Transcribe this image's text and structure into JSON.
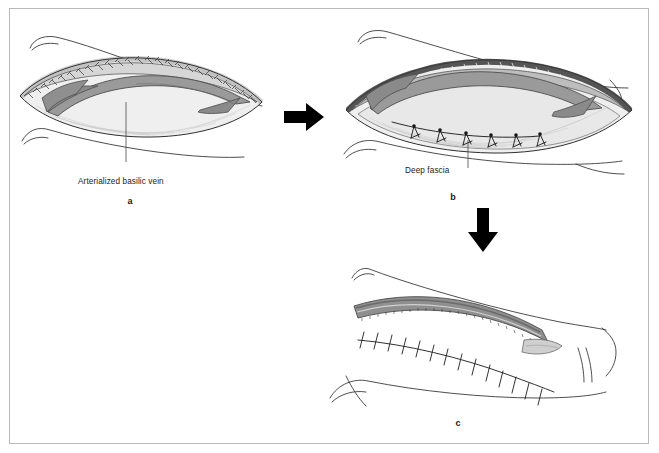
{
  "figure": {
    "type": "surgical-technique-illustration",
    "background_color": "#ffffff",
    "border_color": "#b9b9b9",
    "ink_color": "#1b1b1b",
    "panel_count": 3
  },
  "panels": [
    {
      "id": "a",
      "letter": "a",
      "name": "panel-a-exposed-vein",
      "annotation": {
        "text": "Arterialized basilic vein",
        "leader": "vertical-line"
      }
    },
    {
      "id": "b",
      "letter": "b",
      "name": "panel-b-fascia-closure",
      "annotation": {
        "text": "Deep fascia",
        "leader": "vertical-line"
      }
    },
    {
      "id": "c",
      "letter": "c",
      "name": "panel-c-skin-closure",
      "annotation": {
        "text": "",
        "leader": "none"
      }
    }
  ],
  "arrows": [
    {
      "name": "arrow-a-to-b",
      "direction": "right",
      "color": "#000000"
    },
    {
      "name": "arrow-b-to-c",
      "direction": "down",
      "color": "#000000"
    }
  ],
  "palette": {
    "skin_line": "#3a3a3a",
    "vein_fill": "#8f8f8f",
    "vein_dark": "#6b6b6b",
    "fascia_fill": "#bdbdbd",
    "subcutaneous_fill": "#e4e4e4",
    "wound_bed": "#efefef",
    "suture": "#1b1b1b",
    "dermis_hatch": "#555555"
  },
  "suture_counts": {
    "panel_b_fascia_sutures": 6,
    "panel_c_skin_sutures": 14
  }
}
